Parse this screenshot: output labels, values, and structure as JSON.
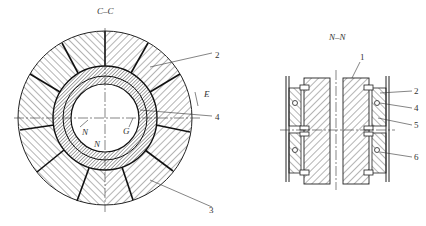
{
  "figure": {
    "left_view": {
      "title": "C–C",
      "labels": {
        "part_2": "2",
        "part_3": "3",
        "part_4": "4",
        "E": "E",
        "G": "G",
        "N_upper": "N",
        "N_lower": "N"
      }
    },
    "right_view": {
      "title": "N–N",
      "labels": {
        "part_1": "1",
        "part_2": "2",
        "part_4": "4",
        "part_5": "5",
        "part_6": "6"
      }
    },
    "colors": {
      "line": "#222222",
      "hatch": "#444444",
      "background": "#ffffff"
    }
  }
}
